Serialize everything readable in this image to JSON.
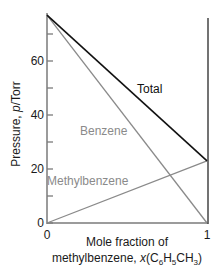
{
  "chart_data": {
    "type": "line",
    "title": "",
    "xlabel": "Mole fraction of methylbenzene, x(C6H5CH3)",
    "xlabel_lines": [
      "Mole fraction of",
      "methylbenzene, "
    ],
    "xlabel_formula": {
      "italic": "x",
      "open": "(C",
      "sub1": "6",
      "mid1": "H",
      "sub2": "5",
      "mid2": "CH",
      "sub3": "3",
      "close": ")"
    },
    "ylabel": "Pressure, p/Torr",
    "ylabel_parts": {
      "text": "Pressure, ",
      "italic": "p",
      "unit": "/Torr"
    },
    "x": [
      0,
      1
    ],
    "xlim": [
      0,
      1
    ],
    "ylim": [
      0,
      77
    ],
    "x_ticks": [
      {
        "value": 0,
        "label": "0"
      },
      {
        "value": 1,
        "label": "1"
      }
    ],
    "y_ticks": [
      {
        "value": 0,
        "label": "0"
      },
      {
        "value": 20,
        "label": "20"
      },
      {
        "value": 40,
        "label": "40"
      },
      {
        "value": 60,
        "label": "60"
      }
    ],
    "y_minor_ticks": [
      10,
      30,
      50,
      70
    ],
    "grid": false,
    "legend": "inline labels",
    "series": [
      {
        "name": "Total",
        "values": [
          77,
          23
        ],
        "color": "#111111",
        "label_pos": {
          "x": 137,
          "y": 93
        }
      },
      {
        "name": "Benzene",
        "values": [
          77,
          0
        ],
        "color": "#8a8a8a",
        "label_pos": {
          "x": 80,
          "y": 135
        }
      },
      {
        "name": "Methylbenzene",
        "values": [
          0,
          23
        ],
        "color": "#8a8a8a",
        "label_pos": {
          "x": 47,
          "y": 185
        }
      }
    ],
    "label_colors": {
      "Total": "#111111",
      "Benzene": "#8a8a8a",
      "Methylbenzene": "#8a8a8a"
    }
  },
  "layout": {
    "x0": 47,
    "x1": 207,
    "y0": 223,
    "px_per_unit": 2.7,
    "right_axis_top": 18
  }
}
